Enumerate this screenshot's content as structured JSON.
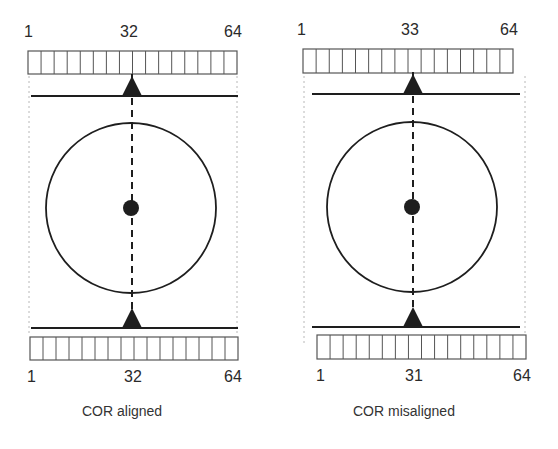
{
  "colors": {
    "ink": "#1e1e1e",
    "cell": "#555555",
    "guide": "#b8b8b8"
  },
  "panels": [
    {
      "id": "aligned",
      "caption": "COR aligned",
      "top_labels": {
        "start": "1",
        "center": "32",
        "end": "64"
      },
      "bottom_labels": {
        "start": "1",
        "center": "32",
        "end": "64"
      },
      "geom": {
        "top_det": {
          "x": 28,
          "y": 51,
          "w": 209,
          "h": 23,
          "cells": 16
        },
        "bot_det": {
          "x": 30,
          "y": 337,
          "w": 208,
          "h": 23,
          "cells": 16
        },
        "top_line": {
          "x1": 31,
          "x2": 238,
          "y": 96
        },
        "bot_line": {
          "x1": 31,
          "x2": 238,
          "y": 328
        },
        "axis_x": 132,
        "circle": {
          "cx": 131,
          "cy": 208,
          "r": 85
        },
        "dot_r": 8,
        "guides": {
          "left": 29,
          "right": 237,
          "y1": 76,
          "y2": 333
        }
      },
      "label_pos": {
        "top": {
          "y": 24,
          "start": 24,
          "center": 120,
          "end": 224
        },
        "bottom": {
          "y": 369,
          "start": 27,
          "center": 124,
          "end": 224
        },
        "caption": {
          "x": 82,
          "y": 404
        }
      }
    },
    {
      "id": "misaligned",
      "caption": "COR misaligned",
      "top_labels": {
        "start": "1",
        "center": "33",
        "end": "64"
      },
      "bottom_labels": {
        "start": "1",
        "center": "31",
        "end": "64"
      },
      "geom": {
        "top_det": {
          "x": 303,
          "y": 49,
          "w": 210,
          "h": 24,
          "cells": 16
        },
        "bot_det": {
          "x": 317,
          "y": 335,
          "w": 209,
          "h": 24,
          "cells": 16
        },
        "top_line": {
          "x1": 312,
          "x2": 520,
          "y": 94
        },
        "bot_line": {
          "x1": 312,
          "x2": 520,
          "y": 327
        },
        "axis_x": 413,
        "circle": {
          "cx": 412,
          "cy": 207,
          "r": 85
        },
        "dot_r": 8,
        "guides": {
          "left": 304,
          "right": 525,
          "y1": 76,
          "y2": 345
        }
      },
      "label_pos": {
        "top": {
          "y": 22,
          "start": 297,
          "center": 401,
          "end": 500
        },
        "bottom": {
          "y": 368,
          "start": 316,
          "center": 405,
          "end": 513
        },
        "caption": {
          "x": 353,
          "y": 404
        }
      }
    }
  ]
}
